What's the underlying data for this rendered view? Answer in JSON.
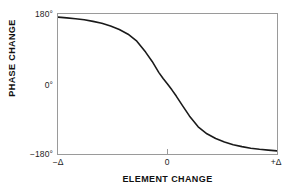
{
  "chart_data": {
    "type": "line",
    "title": "",
    "xlabel": "ELEMENT CHANGE",
    "ylabel": "PHASE CHANGE",
    "x_tick_labels": [
      "−Δ",
      "0",
      "+Δ"
    ],
    "y_tick_labels": [
      "180°",
      "0°",
      "−180°"
    ],
    "xlim": [
      -1,
      1
    ],
    "ylim": [
      -180,
      180
    ],
    "grid": false,
    "legend": null,
    "annotations": [],
    "series": [
      {
        "name": "phase response",
        "color": "#1a1a1a",
        "line_width": 1.6,
        "x": [
          -1.0,
          -0.92,
          -0.84,
          -0.76,
          -0.68,
          -0.6,
          -0.52,
          -0.44,
          -0.36,
          -0.28,
          -0.2,
          -0.14,
          -0.08,
          -0.04,
          0.0,
          0.04,
          0.08,
          0.14,
          0.2,
          0.28,
          0.36,
          0.44,
          0.52,
          0.6,
          0.68,
          0.76,
          0.84,
          0.92,
          1.0
        ],
        "y": [
          172,
          170,
          168,
          165,
          161,
          156,
          149,
          140,
          128,
          110,
          82,
          58,
          30,
          14,
          0,
          -15,
          -31,
          -57,
          -82,
          -110,
          -128,
          -140,
          -149,
          -156,
          -161,
          -165,
          -168,
          -170,
          -172
        ]
      }
    ]
  },
  "axes": {
    "frame_color": "#9a9a9a",
    "tick_color": "#9a9a9a",
    "label_color": "#1d1d1d",
    "title_color": "#111111",
    "background": "#ffffff"
  }
}
